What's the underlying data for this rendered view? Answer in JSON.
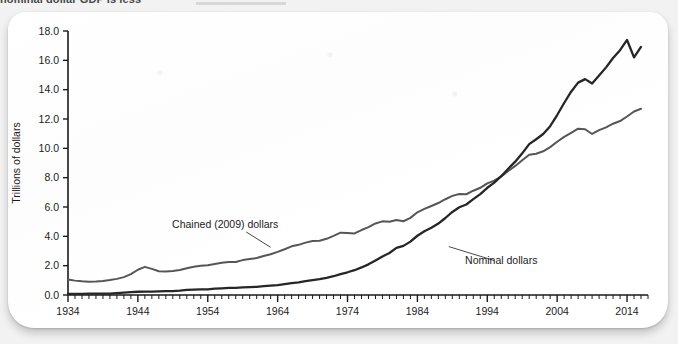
{
  "caption": {
    "text": "nominal dollar GDP is less"
  },
  "chart_data": {
    "type": "line",
    "title": "",
    "xlabel": "",
    "ylabel": "Trillions of dollars",
    "xlim": [
      1934,
      2017
    ],
    "ylim": [
      0.0,
      18.0
    ],
    "grid": false,
    "legend_position": "inline-annotations",
    "y_ticks": [
      "0.0",
      "2.0",
      "4.0",
      "6.0",
      "8.0",
      "10.0",
      "12.0",
      "14.0",
      "16.0",
      "18.0"
    ],
    "y_tick_values": [
      0,
      2,
      4,
      6,
      8,
      10,
      12,
      14,
      16,
      18
    ],
    "x_ticks": [
      "1934",
      "1944",
      "1954",
      "1964",
      "1974",
      "1984",
      "1994",
      "2004",
      "2014"
    ],
    "x_tick_values": [
      1934,
      1944,
      1954,
      1964,
      1974,
      1984,
      1994,
      2004,
      2014
    ],
    "x_minor_step": 1,
    "annotations": [
      {
        "name": "chained-dollars-label",
        "text": "Chained (2009) dollars",
        "label_x": 1956.5,
        "label_y": 4.55,
        "leader_from_x": 1959.5,
        "leader_from_y": 4.3,
        "leader_to_x": 1963.0,
        "leader_to_y": 3.25
      },
      {
        "name": "nominal-dollars-label",
        "text": "Nominal dollars",
        "label_x": 1996.0,
        "label_y": 2.1,
        "leader_from_x": 1995.0,
        "leader_from_y": 2.35,
        "leader_to_x": 1988.5,
        "leader_to_y": 3.3
      }
    ],
    "x": [
      1934,
      1935,
      1936,
      1937,
      1938,
      1939,
      1940,
      1941,
      1942,
      1943,
      1944,
      1945,
      1946,
      1947,
      1948,
      1949,
      1950,
      1951,
      1952,
      1953,
      1954,
      1955,
      1956,
      1957,
      1958,
      1959,
      1960,
      1961,
      1962,
      1963,
      1964,
      1965,
      1966,
      1967,
      1968,
      1969,
      1970,
      1971,
      1972,
      1973,
      1974,
      1975,
      1976,
      1977,
      1978,
      1979,
      1980,
      1981,
      1982,
      1983,
      1984,
      1985,
      1986,
      1987,
      1988,
      1989,
      1990,
      1991,
      1992,
      1993,
      1994,
      1995,
      1996,
      1997,
      1998,
      1999,
      2000,
      2001,
      2002,
      2003,
      2004,
      2005,
      2006,
      2007,
      2008,
      2009,
      2010,
      2011,
      2012,
      2013,
      2014,
      2015,
      2016
    ],
    "series": [
      {
        "name": "Chained (2009) dollars",
        "color": "#565656",
        "values": [
          1.05,
          0.98,
          0.93,
          0.9,
          0.92,
          0.96,
          1.02,
          1.1,
          1.22,
          1.42,
          1.72,
          1.92,
          1.78,
          1.62,
          1.6,
          1.63,
          1.7,
          1.82,
          1.92,
          2.0,
          2.03,
          2.12,
          2.2,
          2.25,
          2.25,
          2.38,
          2.45,
          2.52,
          2.66,
          2.78,
          2.94,
          3.12,
          3.32,
          3.42,
          3.57,
          3.68,
          3.7,
          3.83,
          4.03,
          4.25,
          4.23,
          4.2,
          4.43,
          4.63,
          4.88,
          5.02,
          5.0,
          5.12,
          5.03,
          5.26,
          5.64,
          5.87,
          6.07,
          6.27,
          6.53,
          6.76,
          6.89,
          6.87,
          7.11,
          7.31,
          7.61,
          7.8,
          8.09,
          8.45,
          8.8,
          9.19,
          9.56,
          9.63,
          9.8,
          10.08,
          10.45,
          10.78,
          11.06,
          11.34,
          11.3,
          10.98,
          11.24,
          11.43,
          11.68,
          11.86,
          12.17,
          12.51,
          12.7
        ]
      },
      {
        "name": "Nominal dollars",
        "color": "#262626",
        "values": [
          0.07,
          0.07,
          0.08,
          0.09,
          0.09,
          0.09,
          0.1,
          0.13,
          0.16,
          0.2,
          0.22,
          0.23,
          0.23,
          0.25,
          0.27,
          0.27,
          0.3,
          0.35,
          0.37,
          0.39,
          0.39,
          0.43,
          0.45,
          0.48,
          0.48,
          0.52,
          0.54,
          0.56,
          0.6,
          0.64,
          0.68,
          0.74,
          0.81,
          0.86,
          0.94,
          1.02,
          1.08,
          1.17,
          1.28,
          1.43,
          1.55,
          1.69,
          1.88,
          2.09,
          2.36,
          2.63,
          2.86,
          3.21,
          3.35,
          3.64,
          4.04,
          4.35,
          4.59,
          4.87,
          5.25,
          5.66,
          5.98,
          6.17,
          6.54,
          6.88,
          7.31,
          7.66,
          8.1,
          8.61,
          9.09,
          9.66,
          10.29,
          10.62,
          10.98,
          11.51,
          12.27,
          13.09,
          13.86,
          14.48,
          14.72,
          14.42,
          14.96,
          15.52,
          16.16,
          16.69,
          17.39,
          16.2,
          16.92
        ]
      }
    ]
  }
}
